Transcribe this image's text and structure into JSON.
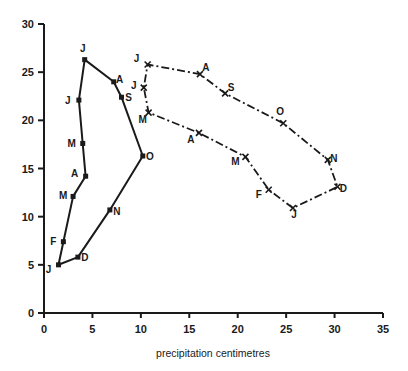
{
  "chart_data": {
    "type": "line",
    "title": "",
    "xlabel": "precipitation centimetres",
    "ylabel": "",
    "xlim": [
      0,
      35
    ],
    "ylim": [
      0,
      30
    ],
    "xticks": [
      0,
      5,
      10,
      15,
      20,
      25,
      30,
      35
    ],
    "yticks": [
      0,
      5,
      10,
      15,
      20,
      25,
      30
    ],
    "grid": false,
    "legend": "none",
    "series": [
      {
        "name": "solid",
        "style": "solid",
        "closed": true,
        "points": [
          {
            "label": "J",
            "x": 1.5,
            "y": 5.0
          },
          {
            "label": "F",
            "x": 2.0,
            "y": 7.4
          },
          {
            "label": "M",
            "x": 3.0,
            "y": 12.1
          },
          {
            "label": "A",
            "x": 4.3,
            "y": 14.2
          },
          {
            "label": "M",
            "x": 4.0,
            "y": 17.6
          },
          {
            "label": "J",
            "x": 3.6,
            "y": 22.1
          },
          {
            "label": "J",
            "x": 4.2,
            "y": 26.3
          },
          {
            "label": "A",
            "x": 7.2,
            "y": 24.0
          },
          {
            "label": "S",
            "x": 8.0,
            "y": 22.4
          },
          {
            "label": "O",
            "x": 10.2,
            "y": 16.3
          },
          {
            "label": "N",
            "x": 6.8,
            "y": 10.7
          },
          {
            "label": "D",
            "x": 3.5,
            "y": 5.8
          }
        ]
      },
      {
        "name": "dash-dot",
        "style": "dashdot",
        "closed": true,
        "points": [
          {
            "label": "J",
            "x": 25.7,
            "y": 10.9
          },
          {
            "label": "F",
            "x": 23.2,
            "y": 12.8
          },
          {
            "label": "M",
            "x": 20.8,
            "y": 16.2
          },
          {
            "label": "A",
            "x": 16.0,
            "y": 18.7
          },
          {
            "label": "M",
            "x": 10.8,
            "y": 20.8
          },
          {
            "label": "J",
            "x": 10.3,
            "y": 23.4
          },
          {
            "label": "J",
            "x": 10.7,
            "y": 25.8
          },
          {
            "label": "A",
            "x": 16.1,
            "y": 24.8
          },
          {
            "label": "S",
            "x": 18.7,
            "y": 22.8
          },
          {
            "label": "O",
            "x": 24.7,
            "y": 19.7
          },
          {
            "label": "N",
            "x": 29.3,
            "y": 15.9
          },
          {
            "label": "D",
            "x": 30.3,
            "y": 13.1
          }
        ]
      }
    ]
  }
}
